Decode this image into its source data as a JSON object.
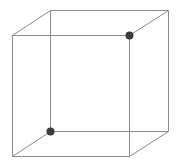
{
  "diagram": {
    "type": "wireframe-cube",
    "background": "#ffffff",
    "edge_color": "#8a8a8a",
    "dot_color": "#3c3c3c",
    "vertices": {
      "front_top_left": [
        12,
        35
      ],
      "front_top_right": [
        129,
        35
      ],
      "front_bottom_left": [
        12,
        156
      ],
      "front_bottom_right": [
        129,
        156
      ],
      "back_top_left": [
        50,
        10
      ],
      "back_top_right": [
        168,
        10
      ],
      "back_bottom_left": [
        50,
        131
      ],
      "back_bottom_right": [
        168,
        131
      ]
    },
    "highlighted_vertices": [
      {
        "name": "front_top_right",
        "x": 129,
        "y": 35,
        "r": 4
      },
      {
        "name": "back_bottom_left",
        "x": 50,
        "y": 131,
        "r": 4
      }
    ]
  }
}
